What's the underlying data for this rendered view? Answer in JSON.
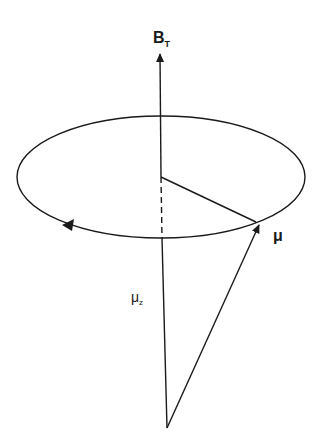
{
  "diagram": {
    "labels": {
      "field": {
        "main": "B",
        "sub": "T"
      },
      "moment": {
        "main": "μ"
      },
      "moment_z": {
        "main": "μ",
        "sub": "z"
      }
    },
    "colors": {
      "stroke": "#1a1a1a",
      "background": "#ffffff"
    },
    "geometry": {
      "field_axis": {
        "x1": 161,
        "y1": 428,
        "x2": 160,
        "y2": 52
      },
      "orbit_ellipse": {
        "cx": 161,
        "cy": 177,
        "rx": 144,
        "ry": 61
      },
      "radius_line": {
        "x1": 161,
        "y1": 177,
        "x2": 255,
        "y2": 222
      },
      "hidden_axis_segment": {
        "x1": 161,
        "y1": 177,
        "x2": 162,
        "y2": 238
      },
      "moment_vector": {
        "x1": 167,
        "y1": 428,
        "x2": 261,
        "y2": 222
      },
      "precession_arrow": {
        "x": 68,
        "y": 225,
        "direction": "left"
      }
    }
  }
}
